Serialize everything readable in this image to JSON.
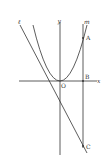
{
  "diagram": {
    "type": "coordinate-geometry",
    "axes": {
      "x_label": "x",
      "y_label": "y",
      "origin_label": "O"
    },
    "lines": {
      "l_label": "ℓ",
      "m_label": "m"
    },
    "points": {
      "A": "A",
      "B": "B",
      "C": "C"
    },
    "colors": {
      "stroke": "#333333",
      "background": "#ffffff"
    }
  }
}
